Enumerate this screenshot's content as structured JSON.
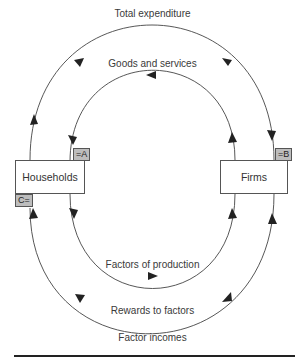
{
  "diagram": {
    "nodes": {
      "households": {
        "label": "Households"
      },
      "firms": {
        "label": "Firms"
      }
    },
    "flows": {
      "outer_top": {
        "label": "Total expenditure",
        "direction": "households-to-firms"
      },
      "inner_top": {
        "label": "Goods and services",
        "direction": "firms-to-households"
      },
      "inner_bottom": {
        "label": "Factors of production",
        "direction": "households-to-firms"
      },
      "outer_bottom_inner_label": {
        "label": "Rewards to factors",
        "direction": "firms-to-households"
      },
      "outer_bottom": {
        "label": "Factor incomes"
      }
    },
    "tags": {
      "a": "=A",
      "b": "=B",
      "c": "C="
    },
    "colors": {
      "line": "#444444",
      "tag_fill": "#bdbdbd",
      "rule": "#222222"
    }
  }
}
